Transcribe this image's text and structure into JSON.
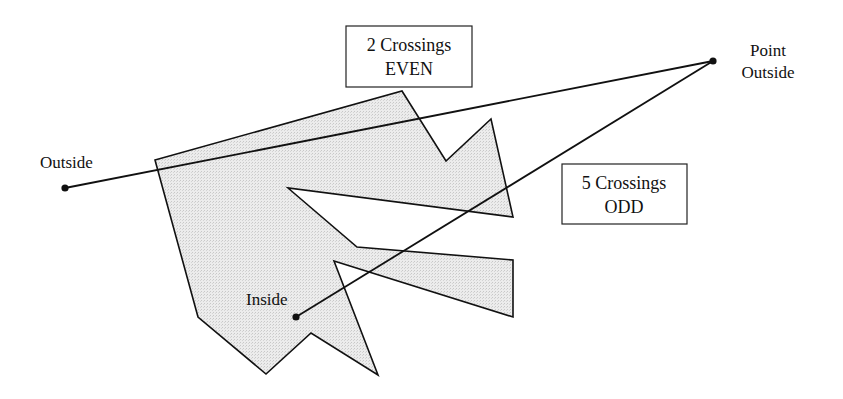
{
  "colors": {
    "fill": "#e6e6e6",
    "stroke": "#111111",
    "background": "#ffffff"
  },
  "polygon": {
    "vertices": [
      [
        155,
        160
      ],
      [
        402,
        91
      ],
      [
        446,
        161
      ],
      [
        491,
        119
      ],
      [
        513,
        217
      ],
      [
        288,
        188
      ],
      [
        357,
        247
      ],
      [
        513,
        260
      ],
      [
        513,
        317
      ],
      [
        334,
        261
      ],
      [
        378,
        375
      ],
      [
        311,
        333
      ],
      [
        266,
        374
      ],
      [
        198,
        317
      ]
    ]
  },
  "points": {
    "outside": {
      "label": "Outside",
      "x": 65,
      "y": 188
    },
    "point_outside": {
      "label_line1": "Point",
      "label_line2": "Outside",
      "x": 713,
      "y": 61
    },
    "inside": {
      "label": "Inside",
      "x": 296,
      "y": 317
    }
  },
  "rays": [
    {
      "from": "outside",
      "to": "point_outside",
      "crossings": 2,
      "parity": "EVEN"
    },
    {
      "from": "inside",
      "to": "point_outside",
      "crossings": 5,
      "parity": "ODD"
    }
  ],
  "boxes": {
    "even": {
      "line1": "2 Crossings",
      "line2": "EVEN"
    },
    "odd": {
      "line1": "5 Crossings",
      "line2": "ODD"
    }
  }
}
